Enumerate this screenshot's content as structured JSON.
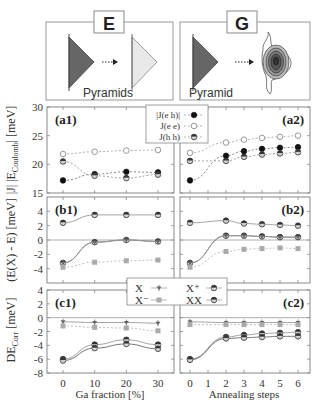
{
  "schematics": {
    "left": {
      "label": "E",
      "caption": "Pyramids"
    },
    "right": {
      "label": "G",
      "caption": "Pyramid"
    }
  },
  "y_labels": {
    "a": "|J| |E_Coulomb| [meV]",
    "a_main": "|E",
    "a_sub": "Coulomb",
    "a_tail": "| [meV]",
    "b": "(E(X) - E)  [meV]",
    "c_main": "DE",
    "c_sub": "Corr",
    "c_tail": "  [meV]"
  },
  "x_labels": {
    "left": "Ga fraction [%]",
    "right": "Annealing steps"
  },
  "legend_a": [
    "|J(e h)|",
    "J(e e)",
    "J(h h)"
  ],
  "legend_bc": [
    "X",
    "X⁻",
    "X⁺",
    "XX"
  ],
  "chart_data": [
    {
      "panel": "a1",
      "type": "line",
      "ylabel": "|E_Coulomb| [meV]",
      "xlabel": "Ga fraction [%]",
      "x": [
        0,
        10,
        20,
        30
      ],
      "xticks": [
        "0",
        "10",
        "20",
        "30"
      ],
      "ylim": [
        15,
        30
      ],
      "yticks": [
        15,
        20,
        25,
        30
      ],
      "series": [
        {
          "name": "|J(e h)|",
          "values": [
            17.2,
            18.3,
            18.7,
            18.6
          ]
        },
        {
          "name": "J(e e)",
          "values": [
            21.8,
            22.2,
            22.4,
            22.5
          ]
        },
        {
          "name": "J(h h)",
          "values": [
            20.5,
            18.0,
            17.6,
            18.2
          ]
        }
      ]
    },
    {
      "panel": "a2",
      "type": "line",
      "xlabel": "Annealing steps",
      "x": [
        0,
        2,
        3,
        4,
        5,
        6
      ],
      "xticks": [
        "0",
        "1",
        "2",
        "3",
        "4",
        "5",
        "6"
      ],
      "ylim": [
        15,
        30
      ],
      "series": [
        {
          "name": "|J(e h)|",
          "values": [
            17.2,
            21.5,
            22.3,
            22.7,
            22.9,
            23.0
          ]
        },
        {
          "name": "J(e e)",
          "values": [
            22.0,
            23.8,
            24.3,
            24.6,
            24.8,
            25.0
          ]
        },
        {
          "name": "J(h h)",
          "values": [
            20.6,
            20.6,
            21.3,
            21.7,
            21.9,
            22.1
          ]
        }
      ]
    },
    {
      "panel": "b1",
      "type": "line",
      "ylabel": "(E(X) - E) [meV]",
      "xlabel": "Ga fraction [%]",
      "x": [
        0,
        10,
        20,
        30
      ],
      "ylim": [
        -6,
        6
      ],
      "yticks": [
        -4,
        -2,
        0,
        2,
        4
      ],
      "series": [
        {
          "name": "X+",
          "values": [
            2.4,
            3.5,
            3.5,
            3.5
          ]
        },
        {
          "name": "XX",
          "values": [
            -3.2,
            -0.3,
            0.0,
            -0.2
          ]
        },
        {
          "name": "X",
          "values": [
            -3.2,
            -0.3,
            0.0,
            -0.2
          ]
        },
        {
          "name": "X-",
          "values": [
            -3.8,
            -3.1,
            -2.9,
            -2.8
          ]
        }
      ]
    },
    {
      "panel": "b2",
      "type": "line",
      "xlabel": "Annealing steps",
      "x": [
        0,
        2,
        3,
        4,
        5,
        6
      ],
      "ylim": [
        -6,
        6
      ],
      "series": [
        {
          "name": "X+",
          "values": [
            2.4,
            2.7,
            2.3,
            2.2,
            2.1,
            2.0
          ]
        },
        {
          "name": "XX",
          "values": [
            -3.2,
            0.6,
            0.6,
            0.5,
            0.4,
            0.4
          ]
        },
        {
          "name": "X",
          "values": [
            -3.2,
            0.6,
            0.6,
            0.5,
            0.4,
            0.4
          ]
        },
        {
          "name": "X-",
          "values": [
            -3.8,
            -1.6,
            -1.3,
            -1.2,
            -1.1,
            -1.2
          ]
        }
      ]
    },
    {
      "panel": "c1",
      "type": "line",
      "ylabel": "DE_Corr [meV]",
      "xlabel": "Ga fraction [%]",
      "x": [
        0,
        10,
        20,
        30
      ],
      "ylim": [
        -8,
        4
      ],
      "yticks": [
        -8,
        -6,
        -4,
        -2,
        0,
        2,
        4
      ],
      "series": [
        {
          "name": "X",
          "values": [
            -0.6,
            -0.7,
            -0.7,
            -0.8
          ]
        },
        {
          "name": "X-",
          "values": [
            -1.2,
            -1.4,
            -1.5,
            -1.9
          ]
        },
        {
          "name": "X+",
          "values": [
            -6.0,
            -3.9,
            -3.2,
            -3.9
          ]
        },
        {
          "name": "XX",
          "values": [
            -6.2,
            -4.4,
            -3.8,
            -4.5
          ]
        }
      ]
    },
    {
      "panel": "c2",
      "type": "line",
      "xlabel": "Annealing steps",
      "x": [
        0,
        2,
        3,
        4,
        5,
        6
      ],
      "ylim": [
        -8,
        4
      ],
      "series": [
        {
          "name": "X",
          "values": [
            -0.6,
            -0.7,
            -0.7,
            -0.7,
            -0.7,
            -0.7
          ]
        },
        {
          "name": "X-",
          "values": [
            -1.0,
            -1.0,
            -1.0,
            -1.0,
            -1.0,
            -1.0
          ]
        },
        {
          "name": "X+",
          "values": [
            -6.0,
            -2.8,
            -2.5,
            -2.3,
            -2.2,
            -2.1
          ]
        },
        {
          "name": "XX",
          "values": [
            -6.1,
            -3.0,
            -2.9,
            -2.8,
            -2.7,
            -2.7
          ]
        }
      ]
    }
  ]
}
